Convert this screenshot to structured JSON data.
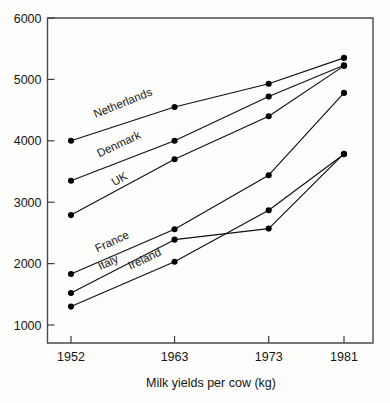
{
  "chart_data": {
    "type": "line",
    "title": "",
    "xlabel": "Milk yields per cow (kg)",
    "ylabel": "",
    "categories": [
      "1952",
      "1963",
      "1973",
      "1981"
    ],
    "x": [
      1952,
      1963,
      1973,
      1981
    ],
    "xlim": [
      1948,
      1985
    ],
    "ylim": [
      600,
      6000
    ],
    "yticks": [
      1000,
      2000,
      3000,
      4000,
      5000,
      6000
    ],
    "ytick_labels": [
      "1000",
      "2000",
      "3000",
      "4000",
      "5000",
      "6000"
    ],
    "xticks": [
      1952,
      1963,
      1973,
      1981
    ],
    "xtick_labels": [
      "1952",
      "1963",
      "1973",
      "1981"
    ],
    "grid": false,
    "legend_position": "inline-labels",
    "marker": "filled-circle",
    "series": [
      {
        "name": "Netherlands",
        "values": [
          4000,
          4550,
          4930,
          5350
        ],
        "label_x": 1954.6,
        "label_y": 4370,
        "label_angle": -22
      },
      {
        "name": "Denmark",
        "values": [
          3350,
          4000,
          4720,
          5230
        ],
        "label_x": 1955.0,
        "label_y": 3730,
        "label_angle": -25
      },
      {
        "name": "UK",
        "values": [
          2790,
          3700,
          4400,
          5220
        ],
        "label_x": 1956.6,
        "label_y": 3260,
        "label_angle": -29
      },
      {
        "name": "France",
        "values": [
          1830,
          2560,
          3440,
          4780
        ],
        "label_x": 1954.8,
        "label_y": 2180,
        "label_angle": -25
      },
      {
        "name": "Italy",
        "values": [
          1520,
          2390,
          2570,
          3790
        ],
        "label_x": 1955.1,
        "label_y": 1890,
        "label_angle": -25
      },
      {
        "name": "Ireland",
        "values": [
          1300,
          2030,
          2870,
          3780
        ],
        "label_x": 1958.3,
        "label_y": 1900,
        "label_angle": -25
      }
    ]
  },
  "axes": {
    "x_axis_title": "Milk yields per cow (kg)"
  }
}
